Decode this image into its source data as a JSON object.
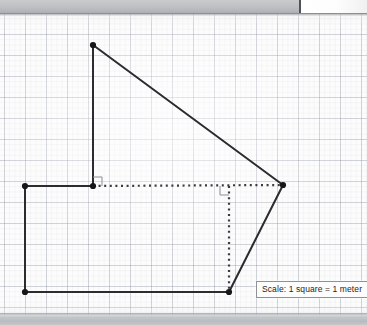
{
  "scene": {
    "width": 367,
    "height": 325,
    "background_color": "#fcfcfc",
    "grid": {
      "major_spacing_px": 21,
      "minor_spacing_px": 5.25,
      "major_color": "#8894a1",
      "minor_color": "#b9c0c9"
    },
    "desk_band_color": "#bfc2c5",
    "desk_highlight_color": "#ffffff"
  },
  "labels": {
    "scale_note": "Scale: 1 square = 1 meter"
  },
  "figure": {
    "stroke_color": "#2b2b30",
    "dotted_color": "#3a3a40",
    "right_angle_color": "#8b8d92",
    "vertex_color": "#17171a",
    "vertices": [
      {
        "id": "A",
        "name": "top-apex",
        "x": 93,
        "y": 45
      },
      {
        "id": "B",
        "name": "right-apex",
        "x": 283,
        "y": 185
      },
      {
        "id": "C",
        "name": "bottom-right",
        "x": 229,
        "y": 292
      },
      {
        "id": "D",
        "name": "bottom-left",
        "x": 25,
        "y": 292
      },
      {
        "id": "E",
        "name": "mid-left",
        "x": 25,
        "y": 186
      },
      {
        "id": "F",
        "name": "inner-junction",
        "x": 93,
        "y": 186
      }
    ],
    "solid_edges": [
      {
        "name": "apex-to-right-apex",
        "from": "A",
        "to": "B"
      },
      {
        "name": "right-apex-to-bottom",
        "from": "B",
        "to": "C"
      },
      {
        "name": "bottom-edge",
        "from": "C",
        "to": "D"
      },
      {
        "name": "left-edge",
        "from": "D",
        "to": "E"
      },
      {
        "name": "upper-left-edge",
        "from": "E",
        "to": "F"
      },
      {
        "name": "apex-drop",
        "from": "F",
        "to": "A"
      }
    ],
    "dotted_edges": [
      {
        "name": "horizontal-construction",
        "from": "F",
        "to": "B"
      },
      {
        "name": "vertical-construction",
        "from": "G",
        "to": "C"
      }
    ],
    "construction_point": {
      "id": "G",
      "name": "dotted-line-foot",
      "x": 229,
      "y": 186
    },
    "right_angle_markers": [
      {
        "name": "right-angle-at-junction",
        "x": 93,
        "y": 186,
        "dx": 1,
        "dy": -1,
        "size": 9
      },
      {
        "name": "right-angle-at-foot",
        "x": 229,
        "y": 186,
        "dx": -1,
        "dy": 1,
        "size": 9
      }
    ]
  }
}
